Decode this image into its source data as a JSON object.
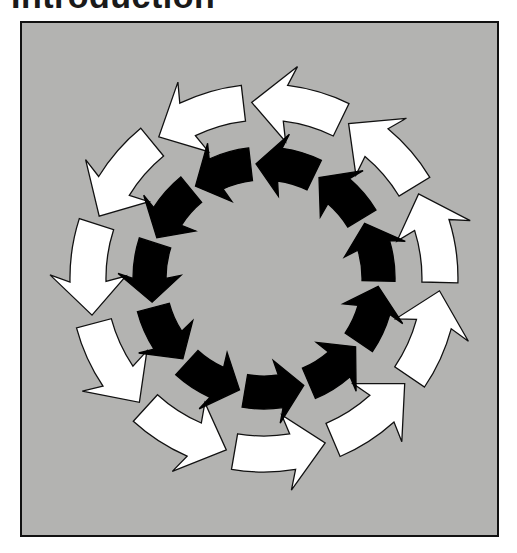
{
  "page": {
    "title": "Introduction"
  },
  "figure": {
    "background_color": "#b3b3b1",
    "frame_color": "#111111",
    "center": [
      264,
      278
    ],
    "rings": [
      {
        "name": "outer-ring",
        "arrow_count": 11,
        "fill": "#ffffff",
        "stroke": "#111111",
        "inner_radius": 158,
        "outer_radius": 194,
        "head_overhang": 20,
        "start_angle_deg": 64,
        "span_deg": 30,
        "head_deg": 11,
        "direction": "counterclockwise"
      },
      {
        "name": "inner-ring",
        "arrow_count": 11,
        "fill": "#000000",
        "stroke": "#000000",
        "inner_radius": 98,
        "outer_radius": 131,
        "head_overhang": 15,
        "start_angle_deg": 64,
        "span_deg": 30,
        "head_deg": 12,
        "direction": "counterclockwise"
      }
    ]
  }
}
